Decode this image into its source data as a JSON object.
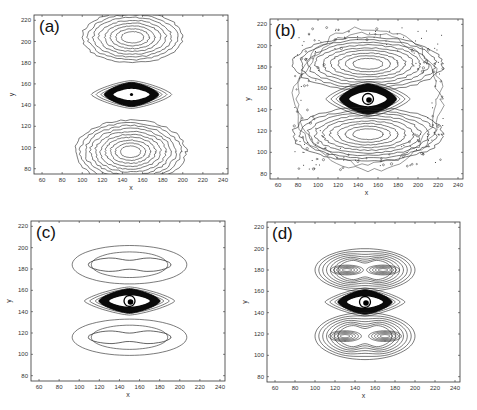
{
  "figure": {
    "panels": [
      {
        "id": "a",
        "label": "(a)",
        "frame": {
          "left": 34,
          "top": 15,
          "right": 228,
          "bottom": 174
        }
      },
      {
        "id": "b",
        "label": "(b)",
        "frame": {
          "left": 270,
          "top": 19,
          "right": 463,
          "bottom": 179
        }
      },
      {
        "id": "c",
        "label": "(c)",
        "frame": {
          "left": 31,
          "top": 221,
          "right": 225,
          "bottom": 381
        }
      },
      {
        "id": "d",
        "label": "(d)",
        "frame": {
          "left": 267,
          "top": 222,
          "right": 460,
          "bottom": 382
        }
      }
    ]
  },
  "chart_data": [
    {
      "type": "contour",
      "panel": "(a)",
      "title": "(a)",
      "xlabel": "x",
      "ylabel": "y",
      "xlim": [
        52,
        245
      ],
      "ylim": [
        75,
        225
      ],
      "xticks": [
        60,
        80,
        100,
        120,
        140,
        160,
        180,
        200,
        220,
        240
      ],
      "yticks": [
        80,
        100,
        120,
        140,
        160,
        180,
        200,
        220
      ],
      "grid": false,
      "features": [
        {
          "kind": "lobe",
          "center": [
            150,
            204
          ],
          "rx_outer": 50,
          "ry_outer": 24,
          "levels": 8,
          "noisy": true
        },
        {
          "kind": "core",
          "center": [
            149,
            150
          ],
          "rx": 40,
          "ry": 12,
          "dense": true
        },
        {
          "kind": "lobe",
          "center": [
            148,
            96
          ],
          "rx_outer": 55,
          "ry_outer": 30,
          "levels": 10,
          "noisy": true
        }
      ]
    },
    {
      "type": "contour",
      "panel": "(b)",
      "title": "(b)",
      "xlabel": "x",
      "ylabel": "y",
      "xlim": [
        52,
        245
      ],
      "ylim": [
        75,
        225
      ],
      "xticks": [
        60,
        80,
        100,
        120,
        140,
        160,
        180,
        200,
        220,
        240
      ],
      "yticks": [
        80,
        100,
        120,
        140,
        160,
        180,
        200,
        220
      ],
      "grid": false,
      "features": [
        {
          "kind": "lobe",
          "center": [
            150,
            183
          ],
          "rx_outer": 75,
          "ry_outer": 25,
          "levels": 9,
          "noisy": true
        },
        {
          "kind": "core",
          "center": [
            150,
            150
          ],
          "rx": 42,
          "ry": 15,
          "dense": true,
          "ring": true
        },
        {
          "kind": "lobe",
          "center": [
            150,
            117
          ],
          "rx_outer": 75,
          "ry_outer": 25,
          "levels": 9,
          "noisy": true
        },
        {
          "kind": "noise-band",
          "extent_x": [
            75,
            225
          ],
          "extent_y": [
            82,
            218
          ]
        }
      ]
    },
    {
      "type": "contour",
      "panel": "(c)",
      "title": "(c)",
      "xlabel": "x",
      "ylabel": "y",
      "xlim": [
        52,
        245
      ],
      "ylim": [
        75,
        225
      ],
      "xticks": [
        60,
        80,
        100,
        120,
        140,
        160,
        180,
        200,
        220,
        240
      ],
      "yticks": [
        80,
        100,
        120,
        140,
        160,
        180,
        200,
        220
      ],
      "grid": false,
      "features": [
        {
          "kind": "lobe",
          "center": [
            150,
            184
          ],
          "rx_outer": 57,
          "ry_outer": 18,
          "levels": 2,
          "inner_pinched": true
        },
        {
          "kind": "core",
          "center": [
            150,
            150
          ],
          "rx": 45,
          "ry": 12,
          "dense": true,
          "ring": true
        },
        {
          "kind": "lobe",
          "center": [
            150,
            116
          ],
          "rx_outer": 57,
          "ry_outer": 17,
          "levels": 2,
          "inner_pinched": true
        }
      ]
    },
    {
      "type": "contour",
      "panel": "(d)",
      "title": "(d)",
      "xlabel": "x",
      "ylabel": "y",
      "xlim": [
        52,
        245
      ],
      "ylim": [
        75,
        225
      ],
      "xticks": [
        60,
        80,
        100,
        120,
        140,
        160,
        180,
        200,
        220,
        240
      ],
      "yticks": [
        80,
        100,
        120,
        140,
        160,
        180,
        200,
        220
      ],
      "grid": false,
      "features": [
        {
          "kind": "lobe",
          "center": [
            150,
            180
          ],
          "rx_outer": 50,
          "ry_outer": 20,
          "levels": 12,
          "double_peak": [
            [
              132,
              180
            ],
            [
              168,
              180
            ]
          ]
        },
        {
          "kind": "core",
          "center": [
            150,
            150
          ],
          "rx": 40,
          "ry": 12,
          "dense": true,
          "ring": true
        },
        {
          "kind": "lobe",
          "center": [
            150,
            118
          ],
          "rx_outer": 50,
          "ry_outer": 22,
          "levels": 12,
          "double_peak": [
            [
              130,
              118
            ],
            [
              170,
              118
            ]
          ]
        }
      ]
    }
  ]
}
